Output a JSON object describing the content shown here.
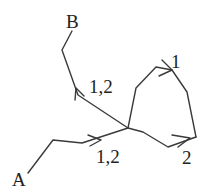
{
  "diagram": {
    "type": "directed path graph",
    "nodes": [
      {
        "id": "A",
        "label": "A"
      },
      {
        "id": "B",
        "label": "B"
      }
    ],
    "edge_labels": {
      "path_to_B": "1,2",
      "path_from_A": "1,2",
      "loop_1": "1",
      "loop_2": "2"
    },
    "colors": {
      "stroke": "#3a3a3a",
      "text": "#222222",
      "background": "#ffffff"
    }
  }
}
